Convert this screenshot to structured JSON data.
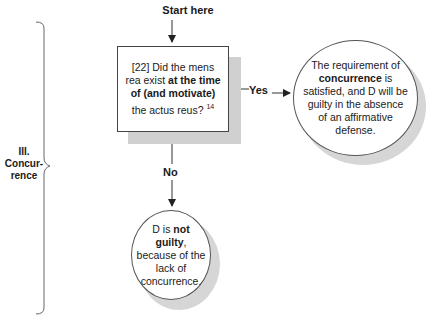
{
  "section": {
    "number": "III.",
    "line1": "Concur-",
    "line2": "rence"
  },
  "start": {
    "label": "Start here"
  },
  "question": {
    "number": "[22]",
    "pre": " Did the mens rea exist ",
    "bold": "at the time of (and motivate)",
    "post": " the actus reus?",
    "footnote": "14"
  },
  "edges": {
    "yes": "Yes",
    "no": "No"
  },
  "outcome_yes": {
    "pre": "The requirement of ",
    "bold": "concurrence",
    "post": " is satisfied, and D will be guilty in the absence of an affirmative defense."
  },
  "outcome_no": {
    "pre": "D is ",
    "bold": "not guilty",
    "post": ", because of the lack of concurrence."
  },
  "colors": {
    "line": "#333333",
    "shadow": "#d0d0d0",
    "background": "#ffffff"
  }
}
